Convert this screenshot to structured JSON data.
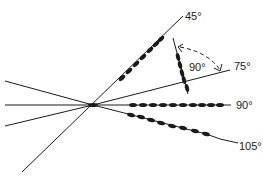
{
  "diagram": {
    "colors": {
      "line": "#1a1a1a",
      "background": "#ffffff"
    },
    "labels": {
      "deg45": "45°",
      "deg75": "75°",
      "deg90": "90°",
      "deg105": "105°",
      "rotation": "90°"
    },
    "lines": [
      {
        "name": "45-degree",
        "label": "45°",
        "beads": 7
      },
      {
        "name": "75-degree",
        "label": "75°",
        "beads": 0
      },
      {
        "name": "90-degree",
        "label": "90°",
        "beads": 10
      },
      {
        "name": "105-degree",
        "label": "105°",
        "beads": 8
      },
      {
        "name": "rotated-segment",
        "label": "90°",
        "beads": 5,
        "annotation": "dashed rotation arrow"
      }
    ]
  }
}
